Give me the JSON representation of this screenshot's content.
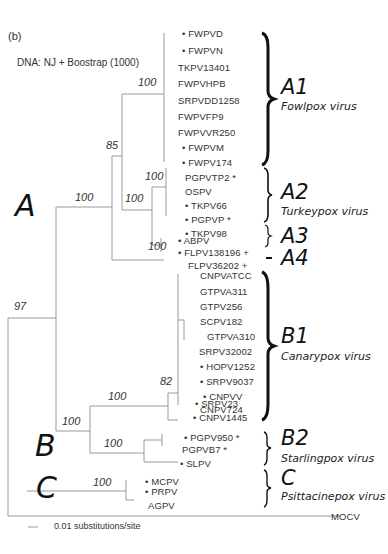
{
  "figure": {
    "panel_label": "(b)",
    "method": "DNA: NJ + Boostrap (1000)",
    "scale_bar": "0.01 substitutions/site",
    "outgroup": "MOCV"
  },
  "clades": {
    "A": "A",
    "B": "B",
    "C": "C",
    "A1": {
      "label": "A1",
      "virus": "Fowlpox virus"
    },
    "A2": {
      "label": "A2",
      "virus": "Turkeypox virus"
    },
    "A3": {
      "label": "A3"
    },
    "A4": {
      "label": "A4"
    },
    "B1": {
      "label": "B1",
      "virus": "Canarypox virus"
    },
    "B2": {
      "label": "B2",
      "virus": "Starlingpox virus"
    },
    "Cg": {
      "label": "C",
      "virus": "Psittacinepox virus"
    }
  },
  "bootstrap": {
    "root": "97",
    "A": "100",
    "A_inner": "85",
    "A1": "100",
    "A2_A3": "100",
    "A2": "100",
    "A3": "100",
    "B": "100",
    "B1": "100",
    "B1_inner": "82",
    "B2": "100",
    "C": "100"
  },
  "taxa": [
    {
      "name": "FWPVD",
      "dot": true
    },
    {
      "name": "FWPVN",
      "dot": true
    },
    {
      "name": "TKPV13401",
      "dot": false
    },
    {
      "name": "FWPVHPB",
      "dot": false
    },
    {
      "name": "SRPVDD1258",
      "dot": false
    },
    {
      "name": "FWPVFP9",
      "dot": false
    },
    {
      "name": "FWPVVR250",
      "dot": false
    },
    {
      "name": "FWPVM",
      "dot": true
    },
    {
      "name": "FWPV174",
      "dot": true
    },
    {
      "name": "PGPVTP2 *",
      "dot": false
    },
    {
      "name": "OSPV",
      "dot": false
    },
    {
      "name": "TKPV66",
      "dot": true
    },
    {
      "name": "PGPVP *",
      "dot": true
    },
    {
      "name": "TKPV98",
      "dot": true
    },
    {
      "name": "ABPV",
      "dot": true
    },
    {
      "name": "FLPV138196 +",
      "dot": true
    },
    {
      "name": "FLPV36202 +",
      "dot": false
    },
    {
      "name": "CNPVATCC",
      "dot": false
    },
    {
      "name": "GTPVA311",
      "dot": false
    },
    {
      "name": "GTPV256",
      "dot": false
    },
    {
      "name": "SCPV182",
      "dot": false
    },
    {
      "name": "GTPVA310",
      "dot": false
    },
    {
      "name": "SRPV32002",
      "dot": false
    },
    {
      "name": "HOPV1252",
      "dot": true
    },
    {
      "name": "SRPV9037",
      "dot": true
    },
    {
      "name": "CNPVV",
      "dot": true
    },
    {
      "name": "CNPV724",
      "dot": false
    },
    {
      "name": "SRPV23",
      "dot": true
    },
    {
      "name": "CNPV1445",
      "dot": true
    },
    {
      "name": "PGPV950 *",
      "dot": true
    },
    {
      "name": "PGPVB7 *",
      "dot": false
    },
    {
      "name": "SLPV",
      "dot": true
    },
    {
      "name": "MCPV",
      "dot": true
    },
    {
      "name": "PRPV",
      "dot": true
    },
    {
      "name": "AGPV",
      "dot": false
    }
  ],
  "taxon_labels": [
    "• FWPVD",
    "• FWPVN",
    "TKPV13401",
    "FWPVHPB",
    "SRPVDD1258",
    "FWPVFP9",
    "FWPVVR250",
    "• FWPVM",
    "• FWPV174",
    "PGPVTP2 *",
    "OSPV",
    "• TKPV66",
    "• PGPVP *",
    "• TKPV98",
    "• ABPV",
    "• FLPV138196 +",
    "FLPV36202 +",
    "CNPVATCC",
    "GTPVA311",
    "GTPV256",
    "SCPV182",
    "GTPVA310",
    "SRPV32002",
    "• HOPV1252",
    "• SRPV9037",
    "• CNPVV",
    "CNPV724",
    "• SRPV23",
    "• CNPV1445",
    "• PGPV950 *",
    "PGPVB7 *",
    "• SLPV",
    "• MCPV",
    "• PRPV",
    "AGPV"
  ]
}
